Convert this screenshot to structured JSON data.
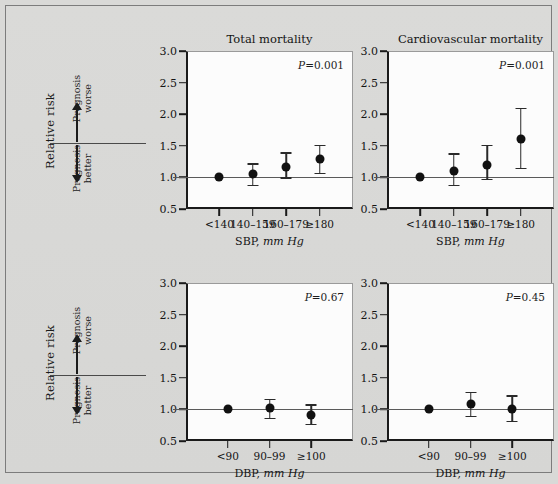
{
  "figure": {
    "background_color": "#d9d9d7",
    "row_axis": {
      "relative_risk_label": "Relative risk",
      "prognosis_worse": "Prognosis\nworse",
      "prognosis_worse_line1": "Prognosis",
      "prognosis_worse_line2": "worse",
      "prognosis_better_line1": "Prognosis",
      "prognosis_better_line2": "better"
    }
  },
  "chart_data": [
    {
      "id": "sbp-total-mortality",
      "type": "scatter",
      "title": "Total mortality",
      "annotation": "P=0.001",
      "p_label_italic": "P",
      "p_label_rest": "=0.001",
      "xlabel_main": "SBP,",
      "xlabel_units": "mm Hg",
      "ylabel": "Relative risk",
      "ylim": [
        0.5,
        3.0
      ],
      "yticks": [
        3.0,
        2.5,
        2.0,
        1.5,
        1.0,
        0.5
      ],
      "ytick_labels": [
        "3.0",
        "2.5",
        "2.0",
        "1.5",
        "1.0",
        "0.5"
      ],
      "categories": [
        "<140",
        "140–159",
        "160–179",
        "≥180"
      ],
      "values": [
        1.0,
        1.05,
        1.17,
        1.29
      ],
      "ci_low": [
        1.0,
        0.88,
        1.0,
        1.07
      ],
      "ci_high": [
        1.0,
        1.22,
        1.4,
        1.52
      ],
      "reference_line": 1.0,
      "grid": false,
      "legend": "none"
    },
    {
      "id": "sbp-cardiovascular-mortality",
      "type": "scatter",
      "title": "Cardiovascular mortality",
      "annotation": "P=0.001",
      "p_label_italic": "P",
      "p_label_rest": "=0.001",
      "xlabel_main": "SBP,",
      "xlabel_units": "mm Hg",
      "ylabel": "Relative risk",
      "ylim": [
        0.5,
        3.0
      ],
      "yticks": [
        3.0,
        2.5,
        2.0,
        1.5,
        1.0,
        0.5
      ],
      "ytick_labels": [
        "3.0",
        "2.5",
        "2.0",
        "1.5",
        "1.0",
        "0.5"
      ],
      "categories": [
        "<140",
        "140–159",
        "160–179",
        "≥180"
      ],
      "values": [
        1.0,
        1.1,
        1.2,
        1.6
      ],
      "ci_low": [
        1.0,
        0.88,
        0.98,
        1.15
      ],
      "ci_high": [
        1.0,
        1.38,
        1.52,
        2.1
      ],
      "reference_line": 1.0,
      "grid": false,
      "legend": "none"
    },
    {
      "id": "dbp-total-mortality",
      "type": "scatter",
      "title": "",
      "annotation": "P=0.67",
      "p_label_italic": "P",
      "p_label_rest": "=0.67",
      "xlabel_main": "DBP,",
      "xlabel_units": "mm Hg",
      "ylabel": "Relative risk",
      "ylim": [
        0.5,
        3.0
      ],
      "yticks": [
        3.0,
        2.5,
        2.0,
        1.5,
        1.0,
        0.5
      ],
      "ytick_labels": [
        "3.0",
        "2.5",
        "2.0",
        "1.5",
        "1.0",
        "0.5"
      ],
      "categories": [
        "<90",
        "90–99",
        "≥100"
      ],
      "values": [
        1.0,
        1.02,
        0.91
      ],
      "ci_low": [
        1.0,
        0.87,
        0.77
      ],
      "ci_high": [
        1.0,
        1.17,
        1.08
      ],
      "reference_line": 1.0,
      "grid": false,
      "legend": "none"
    },
    {
      "id": "dbp-cardiovascular-mortality",
      "type": "scatter",
      "title": "",
      "annotation": "P=0.45",
      "p_label_italic": "P",
      "p_label_rest": "=0.45",
      "xlabel_main": "DBP,",
      "xlabel_units": "mm Hg",
      "ylabel": "Relative risk",
      "ylim": [
        0.5,
        3.0
      ],
      "yticks": [
        3.0,
        2.5,
        2.0,
        1.5,
        1.0,
        0.5
      ],
      "ytick_labels": [
        "3.0",
        "2.5",
        "2.0",
        "1.5",
        "1.0",
        "0.5"
      ],
      "categories": [
        "<90",
        "90–99",
        "≥100"
      ],
      "values": [
        1.0,
        1.08,
        1.0
      ],
      "ci_low": [
        1.0,
        0.9,
        0.82
      ],
      "ci_high": [
        1.0,
        1.28,
        1.22
      ],
      "reference_line": 1.0,
      "grid": false,
      "legend": "none"
    }
  ]
}
